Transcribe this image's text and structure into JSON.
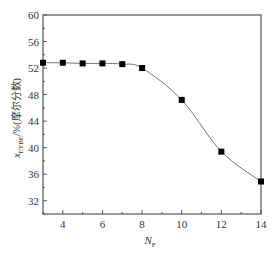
{
  "chart_data": {
    "type": "line",
    "title": "",
    "xlabel": "N_F",
    "xlabel_main": "N",
    "xlabel_sub": "F",
    "ylabel": "x_ETBE/%(摩尔分数)",
    "ylabel_main": "x",
    "ylabel_sub": "ETBE",
    "ylabel_rest": "/%(摩尔分数)",
    "xlim": [
      3,
      14
    ],
    "ylim": [
      30,
      60
    ],
    "xticks": [
      4,
      6,
      8,
      10,
      12,
      14
    ],
    "yticks": [
      32,
      36,
      40,
      44,
      48,
      52,
      56,
      60
    ],
    "grid": false,
    "legend": null,
    "marker": "square",
    "smooth_curve": true,
    "x": [
      3,
      4,
      5,
      6,
      7,
      8,
      10,
      12,
      14
    ],
    "series": [
      {
        "name": "x_ETBE",
        "values": [
          52.8,
          52.8,
          52.7,
          52.7,
          52.6,
          52.0,
          47.2,
          39.4,
          34.9
        ]
      }
    ]
  },
  "labels": {
    "xticks": [
      "4",
      "6",
      "8",
      "10",
      "12",
      "14"
    ],
    "yticks": [
      "32",
      "36",
      "40",
      "44",
      "48",
      "52",
      "56",
      "60"
    ]
  },
  "colors": {
    "axis": "#555555",
    "line": "#777777",
    "marker": "#000000"
  }
}
